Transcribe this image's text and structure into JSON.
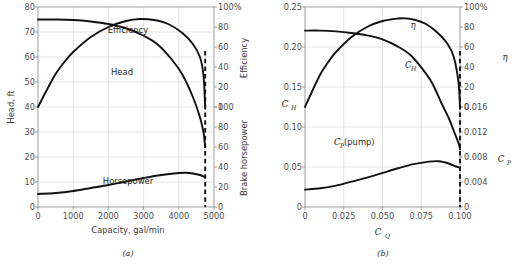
{
  "figure": {
    "panels": [
      {
        "caption": "(a)",
        "xlabel": "Capacity, gal/min",
        "ylabel_left": "Head, ft",
        "ylabel_right_top": "Efficiency",
        "ylabel_right_bottom": "Brake horsepower",
        "x_ticks": [
          "0",
          "1000",
          "2000",
          "3000",
          "4000",
          "5000"
        ],
        "y_left_ticks": [
          "0",
          "10",
          "20",
          "30",
          "40",
          "50",
          "60",
          "70",
          "80"
        ],
        "y_right_top_ticks": [
          "0",
          "20",
          "40",
          "60",
          "80",
          "100%"
        ],
        "y_right_bottom_ticks": [
          "0",
          "20",
          "40",
          "60",
          "80",
          "100"
        ],
        "curve_labels": [
          "Efficiency",
          "Head",
          "Horsepower"
        ]
      },
      {
        "caption": "(b)",
        "xlabel": "C_Q",
        "xlabel_main": "C",
        "xlabel_sub": "Q",
        "ylabel_left_main": "C",
        "ylabel_left_sub": "H",
        "ylabel_right_top": "η",
        "ylabel_right_bottom_main": "C",
        "ylabel_right_bottom_sub": "P",
        "x_ticks": [
          "0",
          "0.025",
          "0.050",
          "0.075",
          "0.100"
        ],
        "y_left_ticks": [
          "0",
          "0.05",
          "0.10",
          "0.15",
          "0.20",
          "0.25"
        ],
        "y_right_top_ticks": [
          "0",
          "20",
          "40",
          "60",
          "80",
          "100%"
        ],
        "y_right_bottom_ticks": [
          "0",
          "0.004",
          "0.008",
          "0.012",
          "0.016"
        ],
        "curve_labels": [
          "η",
          "C_H",
          "C_P (pump)"
        ],
        "curve_label_ch_main": "C",
        "curve_label_ch_sub": "H",
        "curve_label_cp_main": "C",
        "curve_label_cp_sub": "P",
        "curve_label_cp_tail": "(pump)"
      }
    ]
  },
  "chart_data": [
    {
      "type": "line",
      "panel": "a",
      "title": "",
      "xlabel": "Capacity, gal/min",
      "ylabel": "Head, ft",
      "xlim": [
        0,
        5000
      ],
      "grid": true,
      "axes": [
        {
          "name": "head",
          "side": "left",
          "label": "Head, ft",
          "range": [
            0,
            80
          ],
          "ticks": [
            0,
            10,
            20,
            30,
            40,
            50,
            60,
            70,
            80
          ]
        },
        {
          "name": "efficiency",
          "side": "right-top",
          "label": "Efficiency",
          "range": [
            0,
            100
          ],
          "ticks": [
            0,
            20,
            40,
            60,
            80,
            100
          ]
        },
        {
          "name": "bhp",
          "side": "right-bottom",
          "label": "Brake horsepower",
          "range": [
            0,
            100
          ],
          "ticks": [
            0,
            20,
            40,
            60,
            80,
            100
          ]
        }
      ],
      "shutoff_line_x": 4750,
      "series": [
        {
          "name": "Efficiency",
          "axis": "efficiency",
          "x": [
            0,
            250,
            500,
            750,
            1000,
            1500,
            2000,
            2500,
            2900,
            3300,
            3700,
            4100,
            4400,
            4600,
            4700,
            4750
          ],
          "y": [
            0,
            17,
            33,
            45,
            55,
            70,
            80,
            86,
            88,
            87,
            83,
            74,
            63,
            50,
            32,
            0
          ]
        },
        {
          "name": "Head",
          "axis": "head",
          "x": [
            0,
            500,
            1000,
            1500,
            2000,
            2500,
            3000,
            3400,
            3800,
            4100,
            4400,
            4600,
            4700,
            4750
          ],
          "y": [
            75,
            75,
            74.8,
            74.2,
            73.2,
            71.5,
            68.5,
            65,
            59,
            53,
            44,
            36,
            30,
            24
          ]
        },
        {
          "name": "Horsepower",
          "axis": "bhp",
          "x": [
            0,
            500,
            1000,
            1500,
            2000,
            2500,
            3000,
            3500,
            4000,
            4200,
            4400,
            4600,
            4700,
            4750
          ],
          "y": [
            13,
            14,
            16,
            19,
            22,
            25.5,
            29,
            32,
            34,
            34.3,
            33.5,
            32,
            30.5,
            29.5
          ]
        }
      ]
    },
    {
      "type": "line",
      "panel": "b",
      "title": "",
      "xlabel": "C_Q",
      "ylabel": "C_H",
      "xlim": [
        0,
        0.1
      ],
      "grid": true,
      "axes": [
        {
          "name": "ch",
          "side": "left",
          "label": "C_H",
          "range": [
            0,
            0.25
          ],
          "ticks": [
            0,
            0.05,
            0.1,
            0.15,
            0.2,
            0.25
          ]
        },
        {
          "name": "eta",
          "side": "right-top",
          "label": "η",
          "range": [
            0,
            100
          ],
          "ticks": [
            0,
            20,
            40,
            60,
            80,
            100
          ]
        },
        {
          "name": "cp",
          "side": "right-bottom",
          "label": "C_P",
          "range": [
            0,
            0.016
          ],
          "ticks": [
            0,
            0.004,
            0.008,
            0.012,
            0.016
          ]
        }
      ],
      "shutoff_line_x": 0.1,
      "series": [
        {
          "name": "η",
          "axis": "eta",
          "x": [
            0,
            0.005,
            0.01,
            0.015,
            0.02,
            0.03,
            0.04,
            0.05,
            0.06,
            0.065,
            0.07,
            0.078,
            0.085,
            0.092,
            0.096,
            0.099,
            0.1
          ],
          "y": [
            0,
            17,
            33,
            45,
            55,
            70,
            80,
            86,
            88.5,
            88.6,
            87.5,
            83,
            75,
            63,
            50,
            25,
            0
          ]
        },
        {
          "name": "C_H",
          "axis": "ch",
          "x": [
            0,
            0.01,
            0.02,
            0.03,
            0.04,
            0.05,
            0.06,
            0.068,
            0.076,
            0.082,
            0.088,
            0.093,
            0.096,
            0.099,
            0.1
          ],
          "y": [
            0.2205,
            0.2205,
            0.2195,
            0.2175,
            0.2145,
            0.2095,
            0.2005,
            0.19,
            0.172,
            0.155,
            0.13,
            0.11,
            0.095,
            0.08,
            0.072
          ]
        },
        {
          "name": "C_P (pump)",
          "axis": "cp",
          "x": [
            0,
            0.01,
            0.02,
            0.03,
            0.04,
            0.05,
            0.06,
            0.07,
            0.08,
            0.086,
            0.09,
            0.094,
            0.097,
            0.1
          ],
          "y": [
            0.00278,
            0.003,
            0.00342,
            0.00405,
            0.0047,
            0.00545,
            0.0062,
            0.00685,
            0.00726,
            0.00733,
            0.00716,
            0.00684,
            0.00652,
            0.0063
          ]
        }
      ]
    }
  ]
}
